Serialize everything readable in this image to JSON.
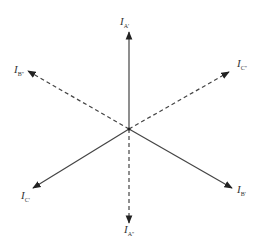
{
  "diagram": {
    "type": "phasor-diagram",
    "center": [
      129,
      129
    ],
    "line_color": "#444444",
    "phasors": [
      {
        "name": "I_A'",
        "label": "I",
        "sub": "A'",
        "style": "solid",
        "end": [
          129,
          32
        ],
        "label_pos": [
          119,
          20
        ]
      },
      {
        "name": "I_B'",
        "label": "I",
        "sub": "B'",
        "style": "solid",
        "end": [
          232,
          188
        ],
        "label_pos": [
          237,
          188
        ]
      },
      {
        "name": "I_C'",
        "label": "I",
        "sub": "C'",
        "style": "solid",
        "end": [
          33,
          188
        ],
        "label_pos": [
          21,
          193
        ]
      },
      {
        "name": "I_A''",
        "label": "I",
        "sub": "A''",
        "style": "dashed",
        "end": [
          129,
          223
        ],
        "label_pos": [
          124,
          226
        ]
      },
      {
        "name": "I_B''",
        "label": "I",
        "sub": "B''",
        "style": "dashed",
        "end": [
          28,
          71
        ],
        "label_pos": [
          14,
          66
        ]
      },
      {
        "name": "I_C''",
        "label": "I",
        "sub": "C''",
        "style": "dashed",
        "end": [
          229,
          72
        ],
        "label_pos": [
          237,
          62
        ]
      }
    ]
  }
}
